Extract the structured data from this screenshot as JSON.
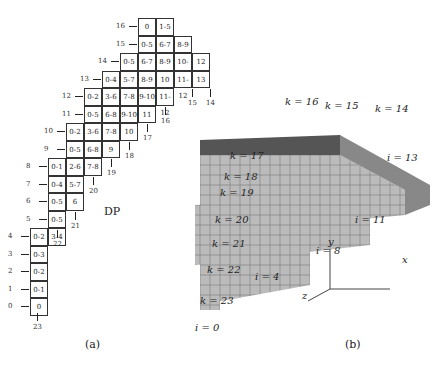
{
  "panel_a": {
    "caption": "(a)",
    "title": "DP",
    "rows": [
      {
        "row": 16,
        "x": 138,
        "cells": [
          "0",
          "1-5"
        ]
      },
      {
        "row": 15,
        "x": 138,
        "cells": [
          "0-5",
          "6-7",
          "8-9"
        ]
      },
      {
        "row": 14,
        "x": 120,
        "cells": [
          "0-5",
          "6-7",
          "8-9",
          "10-11",
          "12"
        ]
      },
      {
        "row": 13,
        "x": 102,
        "cells": [
          "0-4",
          "5-7",
          "8-9",
          "10",
          "11-12",
          "13"
        ]
      },
      {
        "row": 12,
        "x": 84,
        "cells": [
          "0-2",
          "3-6",
          "7-8",
          "9-10",
          "11-12"
        ]
      },
      {
        "row": 11,
        "x": 84,
        "cells": [
          "0-5",
          "6-8",
          "9-10",
          "11"
        ]
      },
      {
        "row": 10,
        "x": 66,
        "cells": [
          "0-2",
          "3-6",
          "7-8",
          "10"
        ]
      },
      {
        "row": 9,
        "x": 66,
        "cells": [
          "0-5",
          "6-8",
          "9"
        ]
      },
      {
        "row": 8,
        "x": 48,
        "cells": [
          "0-1",
          "2-6",
          "7-8"
        ]
      },
      {
        "row": 7,
        "x": 48,
        "cells": [
          "0-4",
          "5-7"
        ]
      },
      {
        "row": 6,
        "x": 48,
        "cells": [
          "0-5",
          "6"
        ]
      },
      {
        "row": 5,
        "x": 48,
        "cells": [
          "0-5"
        ]
      },
      {
        "row": 4,
        "x": 30,
        "cells": [
          "0-2",
          "3-4"
        ]
      },
      {
        "row": 3,
        "x": 30,
        "cells": [
          "0-3"
        ]
      },
      {
        "row": 2,
        "x": 30,
        "cells": [
          "0-2"
        ]
      },
      {
        "row": 1,
        "x": 30,
        "cells": [
          "0-1"
        ]
      },
      {
        "row": 0,
        "x": 30,
        "cells": [
          "0"
        ]
      }
    ],
    "column_labels": [
      {
        "label": "14",
        "x": 210,
        "y": 99
      },
      {
        "label": "15",
        "x": 192,
        "y": 99
      },
      {
        "label": "16",
        "x": 165,
        "y": 117
      },
      {
        "label": "17",
        "x": 147,
        "y": 134
      },
      {
        "label": "18",
        "x": 129,
        "y": 152
      },
      {
        "label": "19",
        "x": 111,
        "y": 169
      },
      {
        "label": "20",
        "x": 93,
        "y": 187
      },
      {
        "label": "21",
        "x": 75,
        "y": 222
      },
      {
        "label": "22",
        "x": 57,
        "y": 240
      },
      {
        "label": "23",
        "x": 37,
        "y": 323
      }
    ]
  },
  "panel_b": {
    "caption": "(b)",
    "k_labels": [
      "k = 16",
      "k = 15",
      "k = 14",
      "k = 17",
      "k = 18",
      "k = 19",
      "k = 20",
      "k = 21",
      "k = 22",
      "k = 23"
    ],
    "i_labels": [
      "i = 13",
      "i = 11",
      "i = 8",
      "i = 4",
      "i = 0"
    ],
    "j_labels": [
      "j = 16",
      "j = 12",
      "j = 8",
      "j = 4",
      "j = 0"
    ],
    "axes": {
      "x": "x",
      "y": "y",
      "z": "z"
    }
  }
}
